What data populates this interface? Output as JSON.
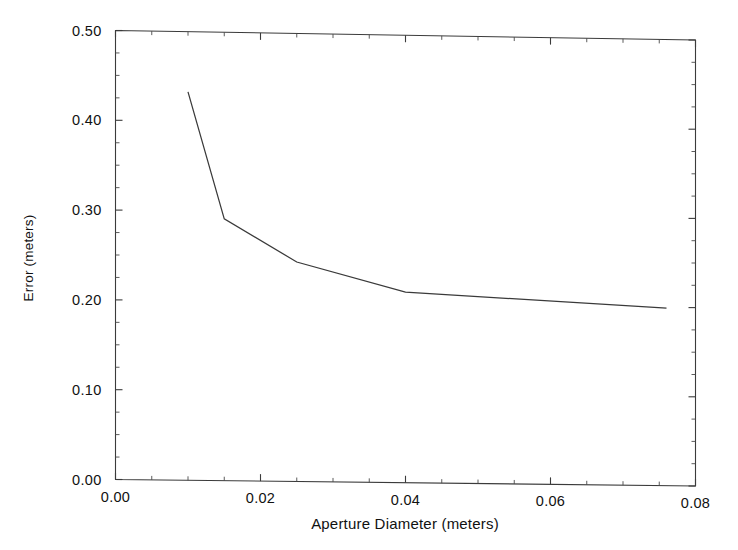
{
  "chart_data": {
    "type": "line",
    "title": "",
    "xlabel": "Aperture Diameter (meters)",
    "ylabel": "Error (meters)",
    "xlim": [
      0.0,
      0.08
    ],
    "ylim": [
      0.0,
      0.5
    ],
    "xticks": [
      0.0,
      0.02,
      0.04,
      0.06,
      0.08
    ],
    "xtick_labels": [
      "0.00",
      "0.02",
      "0.04",
      "0.06",
      "0.08"
    ],
    "yticks": [
      0.0,
      0.1,
      0.2,
      0.3,
      0.4,
      0.5
    ],
    "ytick_labels": [
      "0.00",
      "0.10",
      "0.20",
      "0.30",
      "0.40",
      "0.50"
    ],
    "x_minor_interval": 0.005,
    "y_minor_interval": 0.025,
    "grid": false,
    "legend": null,
    "frame": "box",
    "tick_direction": "in",
    "series": [
      {
        "name": "Error vs Aperture Diameter",
        "color": "#3a3a3a",
        "x": [
          0.01,
          0.015,
          0.025,
          0.04,
          0.076
        ],
        "values": [
          0.433,
          0.292,
          0.245,
          0.213,
          0.199
        ]
      }
    ]
  },
  "labels": {
    "x_axis_title": "Aperture Diameter (meters)",
    "y_axis_title": "Error (meters)"
  }
}
